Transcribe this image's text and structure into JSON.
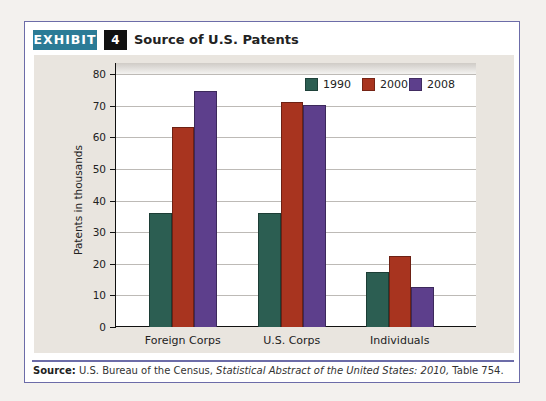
{
  "exhibit": {
    "tag": "EXHIBIT",
    "number": "4",
    "title": "Source of U.S. Patents"
  },
  "source": {
    "label": "Source:",
    "text_before": " U.S. Bureau of the Census, ",
    "italic": "Statistical Abstract of the United States: 2010,",
    "text_after": " Table 754."
  },
  "colors": {
    "1990": "#2c5e52",
    "2000": "#a8341f",
    "2008": "#5d3f8c",
    "exhibit_tag": "#2b7b96",
    "frame": "#6c6ca8",
    "chart_bg": "#e9e5df"
  },
  "chart_data": {
    "type": "bar",
    "title": "Source of U.S. Patents",
    "xlabel": "",
    "ylabel": "Patents in thousands",
    "ylim": [
      0,
      80
    ],
    "yticks": [
      0,
      10,
      20,
      30,
      40,
      50,
      60,
      70,
      80
    ],
    "grid": true,
    "legend_position": "top-right",
    "categories": [
      "Foreign Corps",
      "U.S. Corps",
      "Individuals"
    ],
    "series": [
      {
        "name": "1990",
        "values": [
          36,
          36.2,
          17.5
        ]
      },
      {
        "name": "2000",
        "values": [
          63.3,
          71,
          22.5
        ]
      },
      {
        "name": "2008",
        "values": [
          74.7,
          70.2,
          12.7
        ]
      }
    ]
  }
}
